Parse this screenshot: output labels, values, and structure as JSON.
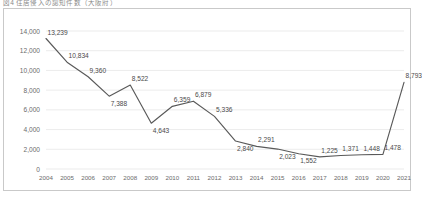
{
  "figure": {
    "title": "図4 住居侵入の認知件数（大阪府）"
  },
  "chart_data": {
    "type": "line",
    "title": "図4 住居侵入の認知件数（大阪府）",
    "xlabel": "",
    "ylabel": "",
    "categories": [
      "2004",
      "2005",
      "2006",
      "2007",
      "2008",
      "2009",
      "2010",
      "2011",
      "2012",
      "2013",
      "2014",
      "2015",
      "2016",
      "2017",
      "2018",
      "2019",
      "2020",
      "2021"
    ],
    "values": [
      13239,
      10834,
      9360,
      7388,
      8522,
      4643,
      6359,
      6879,
      5336,
      2840,
      2291,
      2023,
      1552,
      1225,
      1371,
      1448,
      1478,
      8793
    ],
    "data_labels": [
      "13,239",
      "10,834",
      "9,360",
      "7,388",
      "8,522",
      "4,643",
      "6,359",
      "6,879",
      "5,336",
      "2,840",
      "2,291",
      "2,023",
      "1,552",
      "1,225",
      "1,371",
      "1,448",
      "1,478",
      "8,793"
    ],
    "ylim": [
      0,
      14000
    ],
    "yticks": [
      0,
      2000,
      4000,
      6000,
      8000,
      10000,
      12000,
      14000
    ],
    "ytick_labels": [
      "0",
      "2,000",
      "4,000",
      "6,000",
      "8,000",
      "10,000",
      "12,000",
      "14,000"
    ],
    "grid": true,
    "legend": false,
    "series_color": "#595959",
    "grid_color": "#e3e3e3",
    "border_color": "#c9c9c9"
  }
}
